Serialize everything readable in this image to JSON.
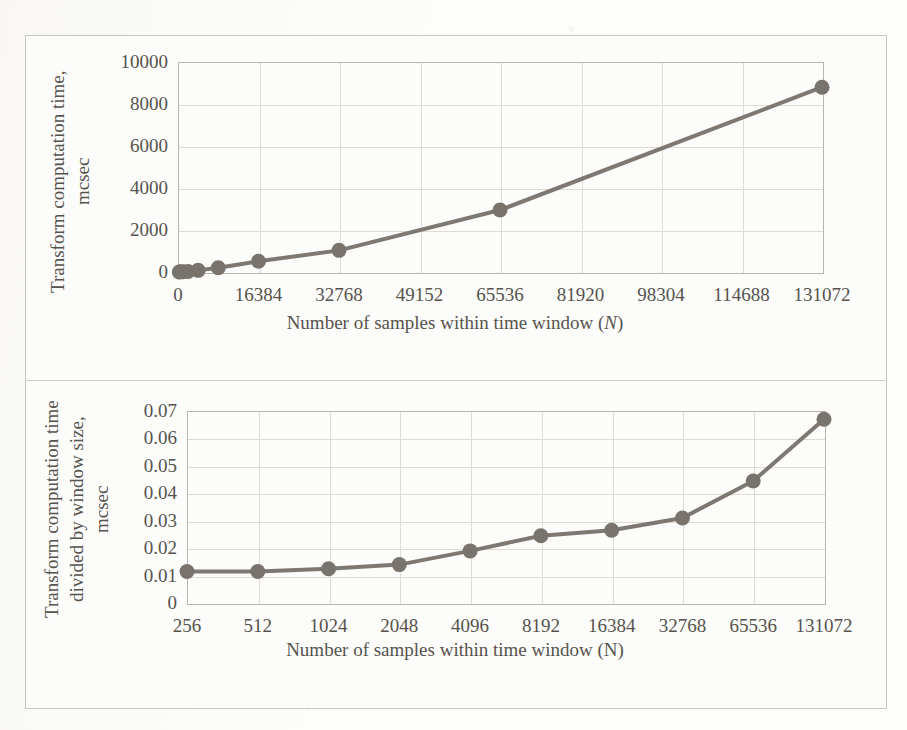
{
  "figure": {
    "background_color": "#fcfcfa",
    "frame_color": "#c9c6bf",
    "series_color": "#7d7872",
    "grid_color": "#dedbd4",
    "text_color": "#56534e"
  },
  "chart_data": [
    {
      "id": "transform-computation-time",
      "type": "line",
      "title": "",
      "xlabel": "Number of samples within time window (N)",
      "xlabel_prefix": "Number of samples within time window (",
      "xlabel_symbol": "N",
      "xlabel_suffix": ")",
      "xlabel_symbol_italic": true,
      "ylabel": "Transform computation time, mcsec",
      "ylabel_lines": [
        "Transform computation time,",
        "mcsec"
      ],
      "xlim": [
        0,
        131072
      ],
      "ylim": [
        0,
        10000
      ],
      "xticks": [
        0,
        16384,
        32768,
        49152,
        65536,
        81920,
        98304,
        114688,
        131072
      ],
      "xtick_labels": [
        "0",
        "16384",
        "32768",
        "49152",
        "65536",
        "81920",
        "98304",
        "114688",
        "131072"
      ],
      "yticks": [
        0,
        2000,
        4000,
        6000,
        8000,
        10000
      ],
      "ytick_labels": [
        "0",
        "2000",
        "4000",
        "6000",
        "8000",
        "10000"
      ],
      "grid": true,
      "legend": "none",
      "marker": "circle",
      "x": [
        256,
        512,
        1024,
        2048,
        4096,
        8192,
        16384,
        32768,
        65536,
        131072
      ],
      "y": [
        3,
        6,
        13,
        29,
        78,
        205,
        510,
        1030,
        2950,
        8800
      ],
      "points": [
        {
          "x": 256,
          "y": 3
        },
        {
          "x": 512,
          "y": 6
        },
        {
          "x": 1024,
          "y": 13
        },
        {
          "x": 2048,
          "y": 29
        },
        {
          "x": 4096,
          "y": 78
        },
        {
          "x": 8192,
          "y": 205
        },
        {
          "x": 16384,
          "y": 510
        },
        {
          "x": 32768,
          "y": 1030
        },
        {
          "x": 65536,
          "y": 2950
        },
        {
          "x": 131072,
          "y": 8800
        }
      ]
    },
    {
      "id": "transform-time-per-window-size",
      "type": "line",
      "title": "",
      "xlabel": "Number of samples within time window (N)",
      "xlabel_prefix": "Number of samples within time window (",
      "xlabel_symbol": "N",
      "xlabel_suffix": ")",
      "xlabel_symbol_italic": false,
      "ylabel": "Transform computation time divided by window size, mcsec",
      "ylabel_lines": [
        "Transform computation time",
        "divided by window size,",
        "mcsec"
      ],
      "ylim": [
        0,
        0.07
      ],
      "xticks": [
        256,
        512,
        1024,
        2048,
        4096,
        8192,
        16384,
        32768,
        65536,
        131072
      ],
      "xtick_labels": [
        "256",
        "512",
        "1024",
        "2048",
        "4096",
        "8192",
        "16384",
        "32768",
        "65536",
        "131072"
      ],
      "yticks": [
        0,
        0.01,
        0.02,
        0.03,
        0.04,
        0.05,
        0.06,
        0.07
      ],
      "ytick_labels": [
        "0",
        "0.01",
        "0.02",
        "0.03",
        "0.04",
        "0.05",
        "0.06",
        "0.07"
      ],
      "grid": true,
      "legend": "none",
      "marker": "circle",
      "categories": [
        "256",
        "512",
        "1024",
        "2048",
        "4096",
        "8192",
        "16384",
        "32768",
        "65536",
        "131072"
      ],
      "values": [
        0.0115,
        0.0115,
        0.0125,
        0.014,
        0.019,
        0.0245,
        0.0265,
        0.031,
        0.0445,
        0.067
      ]
    }
  ]
}
